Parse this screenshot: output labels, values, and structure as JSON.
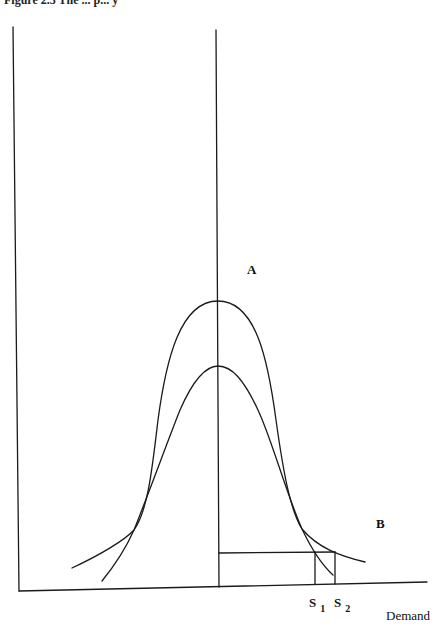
{
  "figure": {
    "caption_partial": "Figure 2.3 The ... p... y",
    "labels": {
      "a": "A",
      "b": "B",
      "s1_main": "S",
      "s1_sub": "1",
      "s2_main": "S",
      "s2_sub": "2",
      "x_axis": "Demand"
    },
    "curves": [
      {
        "name": "A",
        "description": "wide bell-shaped distribution, taller peak"
      },
      {
        "name": "B",
        "description": "narrow bell-shaped distribution, lower peak"
      }
    ],
    "markers": [
      {
        "name": "S1",
        "description": "supply level 1 on demand axis"
      },
      {
        "name": "S2",
        "description": "supply level 2 on demand axis"
      }
    ],
    "colors": {
      "ink": "#1a1a1a",
      "paper": "#ffffff"
    }
  }
}
